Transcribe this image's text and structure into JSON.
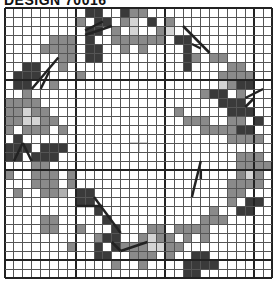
{
  "header": {
    "title": "DESIGN 70016"
  },
  "chart": {
    "cols": 30,
    "rows": 30,
    "major_every": 10,
    "major_offset": 8,
    "colors": {
      ".": "#ffffff",
      "D": "#3a3a3a",
      "M": "#8a8a8a",
      "L": "#d4d4d4",
      "G": "#b0b0b0"
    },
    "grid": [
      ".........DD..DMM..............",
      "........M.DD.ML.D.M...........",
      ".........DD.M.L..ML...........",
      ".....MMM.D..MMMMMM.DD.........",
      "....MMMM.DD..M.M....D.........",
      "......MM.DD.........DM.MM.....",
      "..DD..M.............D....MM...",
      ".DDD....M...............MMMM..",
      ".DD..M..................LMDD..",
      "..M...................MDD.M...",
      "MMMM....................DDD...",
      "MMLMM..............M.....DDD..",
      "MMLLMM..............MMM..MM.D.",
      "M.MMM.M...............MMMMDD..",
      ".D.......................MMMM.",
      "DDD.DDD........................",
      "DD.DDD....................MMM.",
      "...MM.....................MMMM",
      "M..MMM.M..................MLM.",
      "...MMM.M.................MMMM.",
      ".M..MMG.DD...............MM..",
      "........DD...............M.DD.",
      "..........D............M..DD..",
      "....MM.....D..........MMM.....",
      "....MM..M...D...MM.MMMM.......",
      "..........MDD..MLMM.M.M.......",
      ".......M..D.DMMMLLMM..........",
      "..........DD..MMM.M..DD.......",
      "............M..M....DDDD......",
      "....................DD........"
    ],
    "stems": [
      [
        [
          3,
          9
        ],
        [
          6,
          5.5
        ]
      ],
      [
        [
          4,
          9
        ],
        [
          5,
          7
        ]
      ],
      [
        [
          9,
          3
        ],
        [
          12,
          2
        ]
      ],
      [
        [
          11,
          1.5
        ],
        [
          9,
          2.5
        ]
      ],
      [
        [
          20,
          2
        ],
        [
          23,
          5
        ]
      ],
      [
        [
          22,
          4.5
        ],
        [
          21,
          4
        ]
      ],
      [
        [
          27,
          10
        ],
        [
          29,
          9
        ]
      ],
      [
        [
          27,
          11
        ],
        [
          28,
          10
        ]
      ],
      [
        [
          2,
          15
        ],
        [
          1,
          17
        ]
      ],
      [
        [
          2,
          15
        ],
        [
          3,
          17
        ]
      ],
      [
        [
          10,
          21
        ],
        [
          13,
          25
        ]
      ],
      [
        [
          11,
          22
        ],
        [
          8,
          22
        ]
      ],
      [
        [
          22,
          17
        ],
        [
          21,
          21
        ]
      ],
      [
        [
          22,
          19
        ],
        [
          22,
          18
        ]
      ],
      [
        [
          13,
          27
        ],
        [
          16,
          26
        ]
      ],
      [
        [
          13,
          27
        ],
        [
          12,
          26
        ]
      ]
    ]
  }
}
